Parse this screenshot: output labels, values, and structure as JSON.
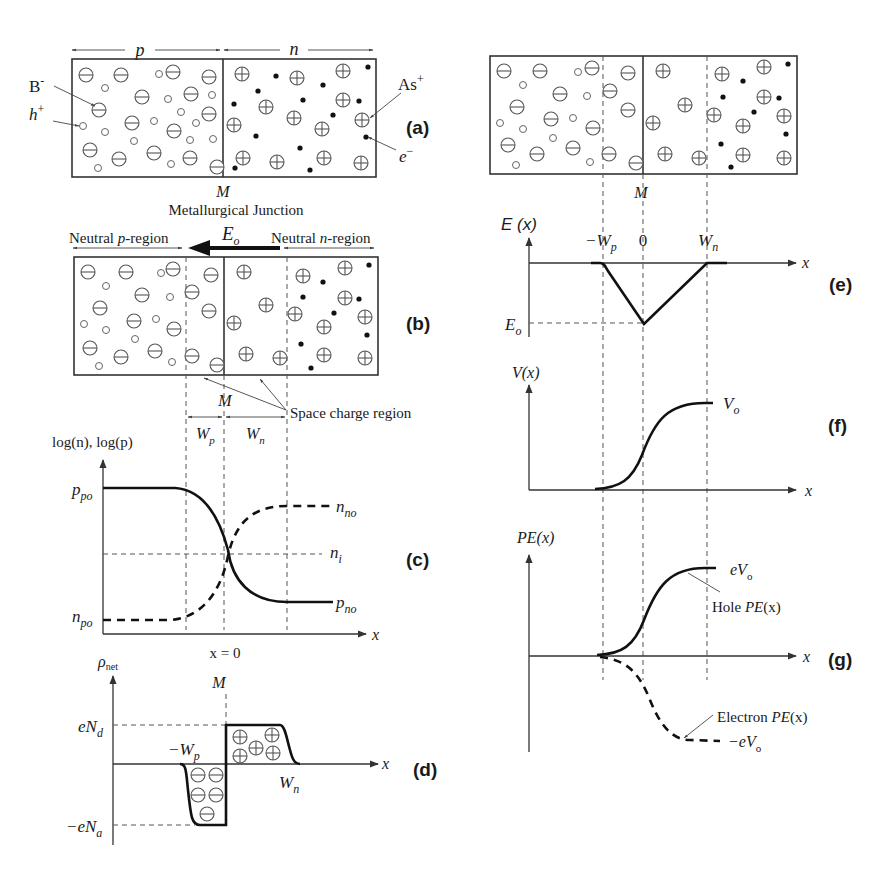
{
  "figure": {
    "panels": {
      "a": {
        "label": "(a)",
        "region_p": "p",
        "region_n": "n",
        "ion_acceptor": "B",
        "ion_acceptor_sup": "-",
        "hole": "h",
        "hole_sup": "+",
        "ion_donor": "As",
        "ion_donor_sup": "+",
        "electron": "e",
        "electron_sup": "−",
        "junction": "M"
      },
      "b": {
        "label": "(b)",
        "junction": "M",
        "junction_title": "Metallurgical Junction",
        "neutral_p_pre": "Neutral ",
        "neutral_p_var": "p",
        "neutral_p_post": "-region",
        "field": "E",
        "field_sub": "o",
        "neutral_n_pre": "Neutral ",
        "neutral_n_var": "n",
        "neutral_n_post": "-region",
        "space_charge": "Space charge region",
        "m_below": "M",
        "wp": "W",
        "wp_sub": "p",
        "wn": "W",
        "wn_sub": "n"
      },
      "c": {
        "label": "(c)",
        "ylabel": "log(n), log(p)",
        "ppo": "p",
        "ppo_sub": "po",
        "nno": "n",
        "nno_sub": "no",
        "ni": "n",
        "ni_sub": "i",
        "pno": "p",
        "pno_sub": "no",
        "npo": "n",
        "npo_sub": "po",
        "xaxis": "x",
        "x0": "x = 0"
      },
      "d": {
        "label": "(d)",
        "ylabel": "ρ",
        "ylabel_sub": "net",
        "junction": "M",
        "end": "eN",
        "end_sub": "d",
        "ena": "−eN",
        "ena_sub": "a",
        "mwp": "−W",
        "mwp_sub": "p",
        "wn": "W",
        "wn_sub": "n",
        "xaxis": "x"
      },
      "e": {
        "label": "(e)",
        "junction": "M",
        "ylabel": "E (x)",
        "mwp": "−W",
        "mwp_sub": "p",
        "zero": "0",
        "wn": "W",
        "wn_sub": "n",
        "eo": "E",
        "eo_sub": "o",
        "xaxis": "x"
      },
      "f": {
        "label": "(f)",
        "ylabel": "V(x)",
        "vo": "V",
        "vo_sub": "o",
        "xaxis": "x"
      },
      "g": {
        "label": "(g)",
        "ylabel": "PE(x)",
        "evo": "eV",
        "evo_sub": "o",
        "hole_pe_pre": "Hole ",
        "hole_pe_var": "PE",
        "hole_pe_post": "(x)",
        "electron_pe_pre": "Electron ",
        "electron_pe_var": "PE",
        "electron_pe_post": "(x)",
        "mevo": "−eV",
        "mevo_sub": "o",
        "xaxis": "x"
      }
    }
  }
}
